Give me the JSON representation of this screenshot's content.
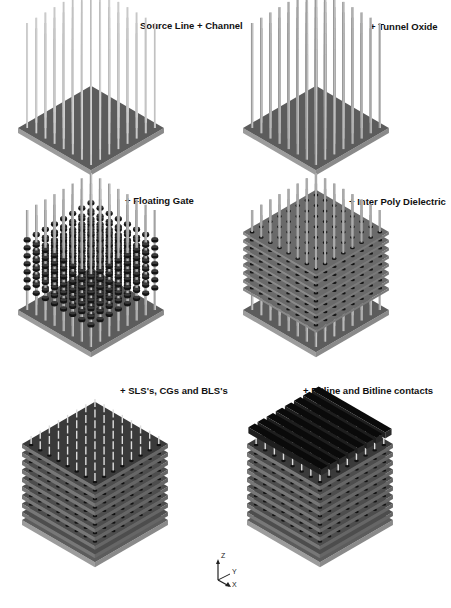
{
  "figure": {
    "panels": [
      {
        "id": "p1",
        "label": "Source Line + Channel",
        "stage": "channel"
      },
      {
        "id": "p2",
        "label": "+ Tunnel Oxide",
        "stage": "oxide"
      },
      {
        "id": "p3",
        "label": "+ Floating Gate",
        "stage": "fg"
      },
      {
        "id": "p4",
        "label": "+ Inter Poly Dielectric",
        "stage": "ipd"
      },
      {
        "id": "p5",
        "label": "+ SLS's, CGs and BLS's",
        "stage": "cg"
      },
      {
        "id": "p6",
        "label": "+ Bitline and Bitline contacts",
        "stage": "bl"
      }
    ],
    "axes": {
      "z": "Z",
      "y": "Y",
      "x": "X"
    },
    "colors": {
      "substrate_top": "#6e6e6e",
      "substrate_side": "#9a9a9a",
      "pillar": "#b8b8b8",
      "floating_gate": "#141414",
      "layer": "#5a5a5a",
      "bitline": "#0a0a0a"
    }
  }
}
